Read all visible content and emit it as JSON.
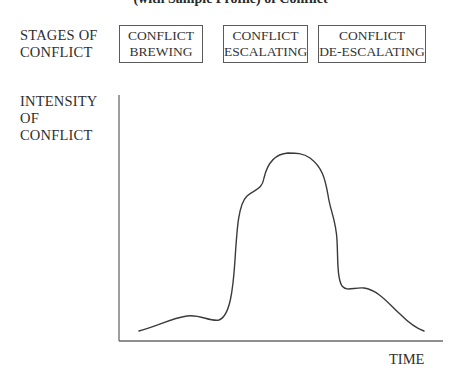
{
  "title": "(with Sample Profile) of Conflict",
  "stages_label": "STAGES OF\nCONFLICT",
  "stages": [
    {
      "label": "CONFLICT\nBREWING",
      "left": 119,
      "width": 84
    },
    {
      "label": "CONFLICT\nESCALATING",
      "left": 223,
      "width": 85
    },
    {
      "label": "CONFLICT\nDE-ESCALATING",
      "left": 318,
      "width": 108
    }
  ],
  "y_axis_label": "INTENSITY\nOF\nCONFLICT",
  "x_axis_label": "TIME",
  "colors": {
    "axis": "#6a6a6a",
    "curve": "#3a3a3a",
    "box_border": "#5a5a5a"
  },
  "chart_data": {
    "type": "line",
    "title": "(with Sample Profile) of Conflict",
    "xlabel": "TIME",
    "ylabel": "INTENSITY OF CONFLICT",
    "axes": {
      "origin": [
        119,
        341
      ],
      "y_top": 95,
      "x_right": 443
    },
    "curve_path": "M139,331 C155,327 172,318 187,316 C200,314 210,322 219,320 C230,316 233,290 235,260 C237,230 238,205 247,196 C255,189 262,190 264,178 C267,165 273,154 288,153 C296,153 303,153 310,158 C322,167 325,178 328,195 C330,210 336,220 337,240 C338,258 337,278 342,286 C347,292 354,287 364,288 C378,290 388,303 400,314 C408,322 415,328 424,331",
    "sample_points": [
      {
        "x": 139,
        "y": 331
      },
      {
        "x": 187,
        "y": 316
      },
      {
        "x": 219,
        "y": 320
      },
      {
        "x": 238,
        "y": 205
      },
      {
        "x": 262,
        "y": 190
      },
      {
        "x": 292,
        "y": 153
      },
      {
        "x": 333,
        "y": 218
      },
      {
        "x": 342,
        "y": 288
      },
      {
        "x": 364,
        "y": 288
      },
      {
        "x": 424,
        "y": 331
      }
    ]
  }
}
